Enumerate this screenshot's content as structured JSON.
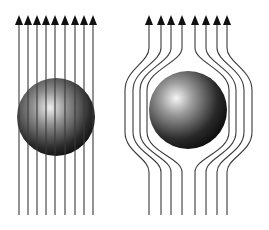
{
  "diagram": {
    "colors": {
      "background": "#ffffff",
      "line": "#3a3a3a",
      "arrow": "#111111",
      "sphere_highlight": "#f2f2f2",
      "sphere_mid": "#8a8a8a",
      "sphere_dark": "#151515"
    },
    "left_panel": {
      "name": "field-penetrates-sphere",
      "line_count": 9,
      "line_x": [
        19,
        28,
        37,
        46,
        55,
        65,
        75,
        84,
        93
      ],
      "line_top": 24,
      "line_bottom": 215,
      "arrow_tip_y": 15,
      "sphere": {
        "cx": 56,
        "cy": 117,
        "r": 39
      }
    },
    "right_panel": {
      "name": "field-excluded-from-sphere",
      "line_count": 8,
      "line_x": [
        149,
        161,
        171,
        182,
        195,
        206,
        217,
        227
      ],
      "line_top": 24,
      "line_bottom": 215,
      "arrow_tip_y": 15,
      "sphere": {
        "cx": 188,
        "cy": 110,
        "r": 39
      },
      "bulge_x": [
        125,
        133,
        140,
        147,
        229,
        236,
        244,
        252
      ]
    }
  }
}
